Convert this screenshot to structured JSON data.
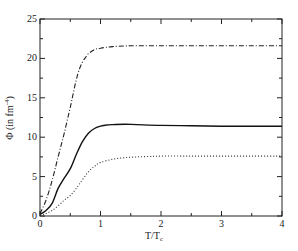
{
  "chart_data": {
    "type": "line",
    "title": "",
    "xlabel": "T/T_c",
    "xlabel_main": "T/T",
    "xlabel_sub": "c",
    "ylabel": "Φ (in fm^-4)",
    "ylabel_main": "Φ (in fm",
    "ylabel_sup": "-4",
    "ylabel_close": ")",
    "xlim": [
      0,
      4
    ],
    "ylim": [
      0,
      25
    ],
    "xticks": [
      0,
      1,
      2,
      3,
      4
    ],
    "xtick_labels": [
      "0",
      "1",
      "2",
      "3",
      "4"
    ],
    "xminor_ticks": [
      0.5,
      1.5,
      2.5,
      3.5
    ],
    "yticks": [
      0,
      5,
      10,
      15,
      20,
      25
    ],
    "ytick_labels": [
      "0",
      "5",
      "10",
      "15",
      "20",
      "25"
    ],
    "yminor_ticks": [
      2.5,
      7.5,
      12.5,
      17.5,
      22.5
    ],
    "grid": false,
    "legend": null,
    "series": [
      {
        "name": "dash-dot curve",
        "style": "dashdot",
        "color": "#222222",
        "x": [
          0,
          0.1,
          0.2,
          0.3,
          0.4,
          0.5,
          0.55,
          0.6,
          0.65,
          0.7,
          0.75,
          0.8,
          0.9,
          1.0,
          1.2,
          1.5,
          2.0,
          2.5,
          3.0,
          3.5,
          4.0
        ],
        "y": [
          0.3,
          2.0,
          4.5,
          7.5,
          10.5,
          13.8,
          15.6,
          17.3,
          18.6,
          19.5,
          20.1,
          20.6,
          21.1,
          21.3,
          21.5,
          21.6,
          21.6,
          21.6,
          21.6,
          21.6,
          21.6
        ]
      },
      {
        "name": "solid curve",
        "style": "solid",
        "color": "#111111",
        "x": [
          0,
          0.1,
          0.2,
          0.3,
          0.4,
          0.5,
          0.6,
          0.7,
          0.8,
          0.9,
          1.0,
          1.1,
          1.2,
          1.4,
          1.6,
          2.0,
          2.5,
          3.0,
          3.5,
          4.0
        ],
        "y": [
          0.2,
          0.7,
          1.6,
          3.5,
          4.8,
          6.0,
          7.8,
          9.4,
          10.5,
          11.1,
          11.4,
          11.55,
          11.6,
          11.65,
          11.6,
          11.5,
          11.45,
          11.4,
          11.4,
          11.4
        ]
      },
      {
        "name": "dotted curve",
        "style": "dotted",
        "color": "#333333",
        "x": [
          0,
          0.1,
          0.2,
          0.3,
          0.4,
          0.5,
          0.6,
          0.7,
          0.8,
          0.9,
          1.0,
          1.2,
          1.4,
          1.6,
          1.8,
          2.0,
          2.5,
          3.0,
          3.5,
          4.0
        ],
        "y": [
          0.1,
          0.3,
          0.7,
          1.3,
          2.0,
          2.6,
          3.5,
          4.6,
          5.6,
          6.3,
          6.8,
          7.2,
          7.4,
          7.5,
          7.55,
          7.6,
          7.6,
          7.6,
          7.6,
          7.6
        ]
      }
    ]
  }
}
